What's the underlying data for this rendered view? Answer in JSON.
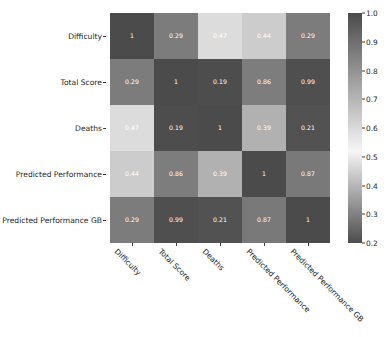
{
  "chart_data": {
    "type": "heatmap",
    "title": "",
    "xlabel": "",
    "ylabel": "",
    "categories": [
      "Difficulty",
      "Total Score",
      "Deaths",
      "Predicted Performance",
      "Predicted Performance GB"
    ],
    "x_tick_labels": [
      "Difficulty",
      "Total Score",
      "Deaths",
      "Predicted Performance",
      "Predicted Performance GB"
    ],
    "y_tick_labels": [
      "Difficulty",
      "Total Score",
      "Deaths",
      "Predicted Performance",
      "Predicted Performance GB"
    ],
    "matrix": [
      [
        1,
        0.29,
        0.47,
        0.44,
        0.29
      ],
      [
        0.29,
        1,
        0.19,
        0.86,
        0.99
      ],
      [
        0.47,
        0.19,
        1,
        0.39,
        0.21
      ],
      [
        0.44,
        0.86,
        0.39,
        1,
        0.87
      ],
      [
        0.29,
        0.99,
        0.21,
        0.87,
        1
      ]
    ],
    "cell_labels": [
      [
        "1",
        "0.29",
        "0.47",
        "0.44",
        "0.29"
      ],
      [
        "0.29",
        "1",
        "0.19",
        "0.86",
        "0.99"
      ],
      [
        "0.47",
        "0.19",
        "1",
        "0.39",
        "0.21"
      ],
      [
        "0.44",
        "0.86",
        "0.39",
        "1",
        "0.87"
      ],
      [
        "0.29",
        "0.99",
        "0.21",
        "0.87",
        "1"
      ]
    ],
    "annotations": true,
    "grid": false,
    "colorbar": {
      "vmin": 0.2,
      "vmax": 1.0,
      "tick_labels": [
        "1.0",
        "0.9",
        "0.8",
        "0.7",
        "0.6",
        "0.5",
        "0.4",
        "0.3",
        "0.2"
      ],
      "tick_values": [
        1.0,
        0.9,
        0.8,
        0.7,
        0.6,
        0.5,
        0.4,
        0.3,
        0.2
      ],
      "orientation": "vertical",
      "position": "right"
    },
    "colors": {
      "background": "#ffffff",
      "text": "#262626",
      "cell_text": "#ffffff",
      "dark": "#4d4d4d",
      "light": "#e8e8e8"
    }
  }
}
